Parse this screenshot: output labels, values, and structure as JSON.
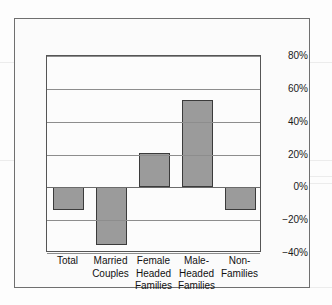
{
  "chart_data": {
    "type": "bar",
    "title": "",
    "subtitle": "",
    "xlabel": "",
    "ylabel": "",
    "categories": [
      "Total",
      "Married\nCouples",
      "Female\nHeaded\nFamilies",
      "Male-\nHeaded\nFamilies",
      "Non-\nFamilies"
    ],
    "values": [
      -14,
      -35,
      21,
      53,
      -14
    ],
    "ylim": [
      -40,
      80
    ],
    "yticks": [
      80,
      60,
      40,
      20,
      0,
      -20,
      -40
    ],
    "ytick_labels": [
      "80%",
      "60%",
      "40%",
      "20%",
      "0%",
      "−20%",
      "−40%"
    ],
    "grid": true,
    "legend": "none",
    "tick_label_position": "right",
    "bar_color": "#9b9b9b",
    "bar_edge_color": "#3b3b3b",
    "gridline_color": "#8d8d8d",
    "plot_background": "#fcfcfc",
    "frame_color": "#6f6f6f"
  }
}
